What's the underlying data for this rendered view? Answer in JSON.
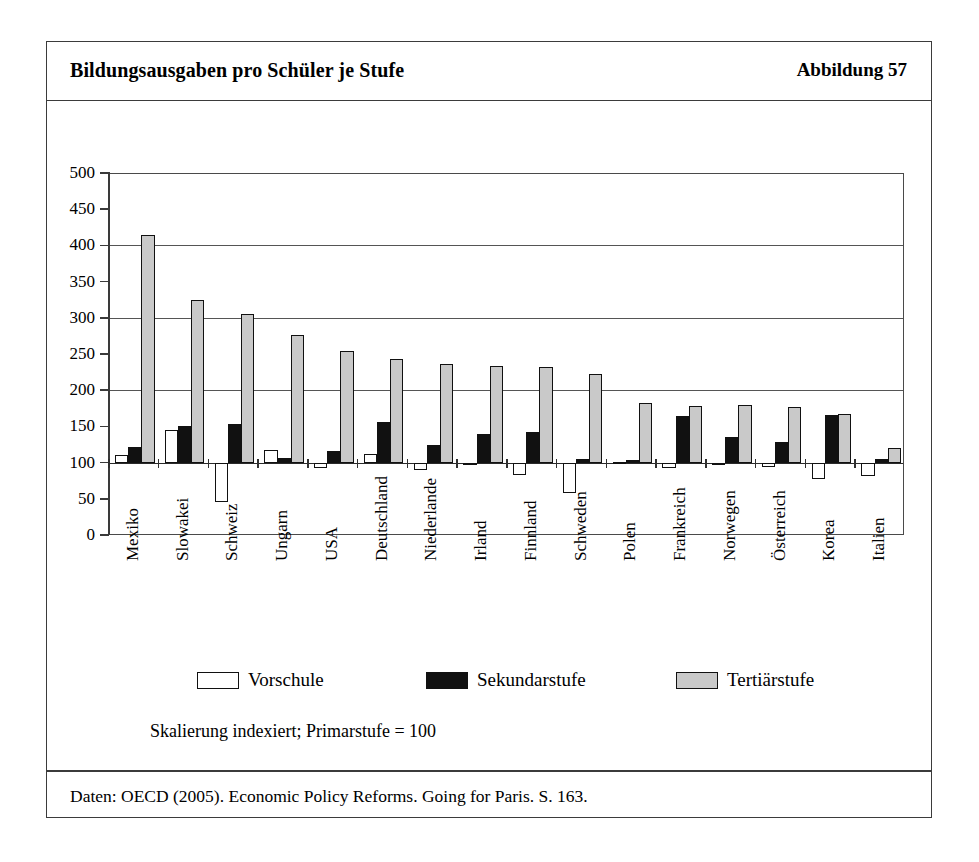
{
  "header": {
    "title": "Bildungsausgaben pro Schüler je Stufe",
    "figure_number": "Abbildung 57"
  },
  "notes": {
    "scale": "Skalierung indexiert; Primarstufe = 100",
    "source": "Daten: OECD (2005). Economic Policy Reforms. Going for Paris. S. 163."
  },
  "colors": {
    "vorschule": "#ffffff",
    "sekundarstufe": "#111111",
    "tertiaerstufe": "#c9c9c9",
    "frame": "#3b3b3b",
    "axis": "#3a3a3a",
    "grid": "#555555"
  },
  "chart_data": {
    "type": "bar",
    "title": "Bildungsausgaben pro Schüler je Stufe",
    "subtitle": "Skalierung indexiert; Primarstufe = 100",
    "xlabel": "",
    "ylabel": "",
    "ylim": [
      0,
      500
    ],
    "ytick_step": 50,
    "yticks": [
      0,
      50,
      100,
      150,
      200,
      250,
      300,
      350,
      400,
      450,
      500
    ],
    "ytick_labels": [
      "0",
      "50",
      "100",
      "150",
      "200",
      "250",
      "300",
      "350",
      "400",
      "450",
      "500"
    ],
    "gridlines": [
      100,
      200,
      300,
      400,
      500
    ],
    "baseline": 100,
    "grid": true,
    "legend_position": "bottom",
    "categories": [
      "Mexiko",
      "Slowakei",
      "Schweiz",
      "Ungarn",
      "USA",
      "Deutschland",
      "Niederlande",
      "Irland",
      "Finnland",
      "Schweden",
      "Polen",
      "Frankreich",
      "Norwegen",
      "Österreich",
      "Korea",
      "Italien"
    ],
    "series": [
      {
        "name": "Vorschule",
        "color": "#ffffff",
        "values": [
          110,
          145,
          45,
          117,
          92,
          112,
          90,
          100,
          83,
          58,
          101,
          93,
          100,
          94,
          77,
          82
        ]
      },
      {
        "name": "Sekundarstufe",
        "color": "#111111",
        "values": [
          122,
          150,
          153,
          106,
          116,
          156,
          124,
          140,
          142,
          105,
          103,
          164,
          136,
          128,
          166,
          105
        ]
      },
      {
        "name": "Tertiärstufe",
        "color": "#c9c9c9",
        "values": [
          415,
          325,
          305,
          276,
          254,
          243,
          236,
          234,
          232,
          222,
          183,
          178,
          180,
          177,
          167,
          120
        ]
      }
    ]
  },
  "legend": [
    {
      "label": "Vorschule",
      "swatch": "vorschule"
    },
    {
      "label": "Sekundarstufe",
      "swatch": "sekundar"
    },
    {
      "label": "Tertiärstufe",
      "swatch": "tertiaer"
    }
  ]
}
